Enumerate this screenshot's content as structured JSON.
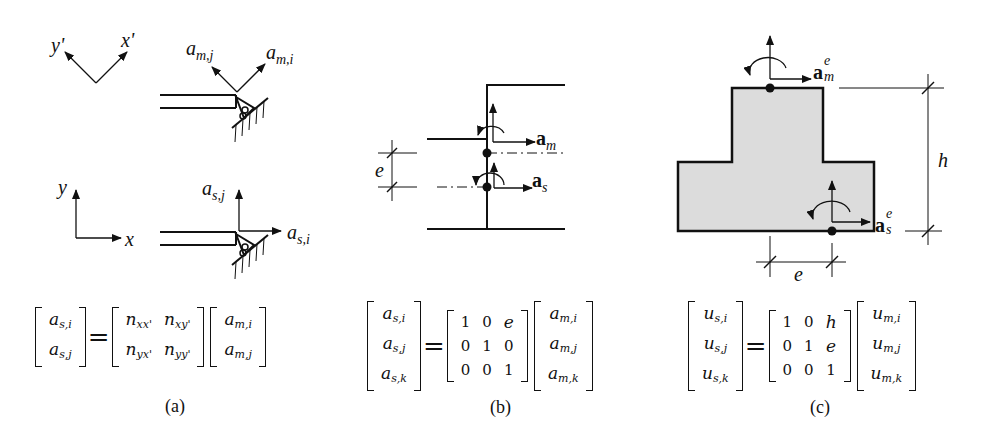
{
  "figure": {
    "panels": [
      {
        "id": "a",
        "caption": "(a)",
        "local_axes": {
          "x": "x'",
          "y": "y'"
        },
        "global_axes": {
          "x": "x",
          "y": "y"
        },
        "master_dofs": {
          "i": "m,i",
          "j": "m,j",
          "base": "a"
        },
        "slave_dofs": {
          "i": "s,i",
          "j": "s,j",
          "base": "a"
        },
        "equation": {
          "lhs": [
            [
              "a",
              "s,i"
            ],
            [
              "a",
              "s,j"
            ]
          ],
          "matrix": [
            [
              [
                "n",
                "xx'"
              ],
              [
                "n",
                "xy'"
              ]
            ],
            [
              [
                "n",
                "yx'"
              ],
              [
                "n",
                "yy'"
              ]
            ]
          ],
          "rhs": [
            [
              "a",
              "m,i"
            ],
            [
              "a",
              "m,j"
            ]
          ],
          "equals": "="
        }
      },
      {
        "id": "b",
        "caption": "(b)",
        "labels": {
          "master": "a",
          "master_sub": "m",
          "slave": "a",
          "slave_sub": "s",
          "offset": "e"
        },
        "equation": {
          "lhs": [
            [
              "a",
              "s,i"
            ],
            [
              "a",
              "s,j"
            ],
            [
              "a",
              "s,k"
            ]
          ],
          "matrix": [
            [
              "1",
              "0",
              "e"
            ],
            [
              "0",
              "1",
              "0"
            ],
            [
              "0",
              "0",
              "1"
            ]
          ],
          "rhs": [
            [
              "a",
              "m,i"
            ],
            [
              "a",
              "m,j"
            ],
            [
              "a",
              "m,k"
            ]
          ],
          "equals": "="
        }
      },
      {
        "id": "c",
        "caption": "(c)",
        "labels": {
          "master": "a",
          "master_sub": "m",
          "master_sup": "e",
          "slave": "a",
          "slave_sub": "s",
          "slave_sup": "e",
          "height": "h",
          "offset": "e"
        },
        "section_fill": "#dcdcdc",
        "equation": {
          "lhs": [
            [
              "u",
              "s,i"
            ],
            [
              "u",
              "s,j"
            ],
            [
              "u",
              "s,k"
            ]
          ],
          "matrix": [
            [
              "1",
              "0",
              "h"
            ],
            [
              "0",
              "1",
              "e"
            ],
            [
              "0",
              "0",
              "1"
            ]
          ],
          "rhs": [
            [
              "u",
              "m,i"
            ],
            [
              "u",
              "m,j"
            ],
            [
              "u",
              "m,k"
            ]
          ],
          "equals": "="
        }
      }
    ]
  }
}
